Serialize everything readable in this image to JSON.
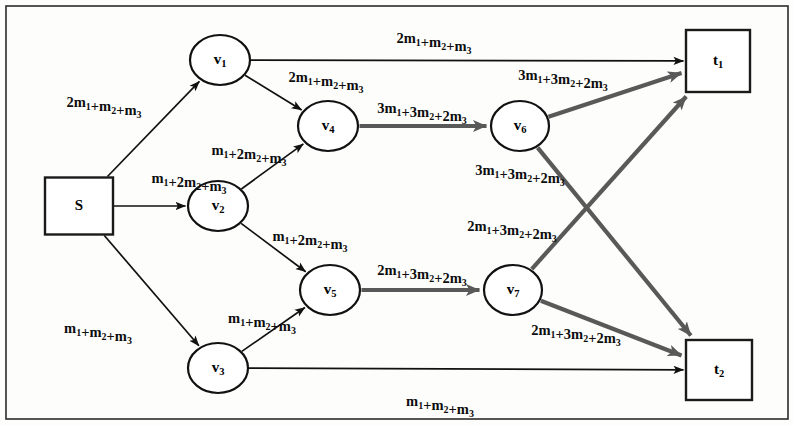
{
  "figure": {
    "kind": "network-flow-graph",
    "width": 794,
    "height": 425,
    "background_color": "#fdfdfb",
    "frame_color": "#2b2b2b",
    "thin_edge_color": "#111111",
    "thick_edge_color": "#595959"
  },
  "nodes": [
    {
      "id": "S",
      "label_main": "S",
      "label_sub": "",
      "shape": "square",
      "cx": 79,
      "cy": 206,
      "w": 68,
      "h": 57
    },
    {
      "id": "v1",
      "label_main": "v",
      "label_sub": "1",
      "shape": "circle",
      "cx": 220,
      "cy": 60,
      "rx": 30,
      "ry": 25
    },
    {
      "id": "v2",
      "label_main": "v",
      "label_sub": "2",
      "shape": "circle",
      "cx": 218,
      "cy": 206,
      "rx": 30,
      "ry": 25
    },
    {
      "id": "v3",
      "label_main": "v",
      "label_sub": "3",
      "shape": "circle",
      "cx": 218,
      "cy": 368,
      "rx": 30,
      "ry": 25
    },
    {
      "id": "v4",
      "label_main": "v",
      "label_sub": "4",
      "shape": "circle",
      "cx": 328,
      "cy": 126,
      "rx": 30,
      "ry": 25
    },
    {
      "id": "v5",
      "label_main": "v",
      "label_sub": "5",
      "shape": "circle",
      "cx": 330,
      "cy": 290,
      "rx": 30,
      "ry": 25
    },
    {
      "id": "v6",
      "label_main": "v",
      "label_sub": "6",
      "shape": "circle",
      "cx": 520,
      "cy": 126,
      "rx": 29,
      "ry": 25
    },
    {
      "id": "v7",
      "label_main": "v",
      "label_sub": "7",
      "shape": "circle",
      "cx": 513,
      "cy": 290,
      "rx": 29,
      "ry": 25
    },
    {
      "id": "t1",
      "label_main": "t",
      "label_sub": "1",
      "shape": "square",
      "cx": 718,
      "cy": 61,
      "w": 64,
      "h": 62
    },
    {
      "id": "t2",
      "label_main": "t",
      "label_sub": "2",
      "shape": "square",
      "cx": 719,
      "cy": 370,
      "w": 66,
      "h": 60
    }
  ],
  "edges": [
    {
      "id": "S-v1",
      "from": "S",
      "to": "v1",
      "style": "thin",
      "label": "2m_1+m_2+m_3",
      "label_x": 104,
      "label_y": 104
    },
    {
      "id": "S-v2",
      "from": "S",
      "to": "v2",
      "style": "thin",
      "label": "m_1+2m_2+m_3",
      "label_x": 189,
      "label_y": 180
    },
    {
      "id": "S-v3",
      "from": "S",
      "to": "v3",
      "style": "thin",
      "label": "m_1+m_2+m_3",
      "label_x": 98,
      "label_y": 330
    },
    {
      "id": "v1-v4",
      "from": "v1",
      "to": "v4",
      "style": "thin",
      "label": "2m_1+m_2+m_3",
      "label_x": 326,
      "label_y": 79
    },
    {
      "id": "v1-t1",
      "from": "v1",
      "to": "t1",
      "style": "thin",
      "label": "2m_1+m_2+m_3",
      "label_x": 434,
      "label_y": 40
    },
    {
      "id": "v2-v4",
      "from": "v2",
      "to": "v4",
      "style": "thin",
      "label": "m_1+2m_2+m_3",
      "label_x": 249,
      "label_y": 152
    },
    {
      "id": "v2-v5",
      "from": "v2",
      "to": "v5",
      "style": "thin",
      "label": "m_1+2m_2+m_3",
      "label_x": 310,
      "label_y": 238
    },
    {
      "id": "v3-v5",
      "from": "v3",
      "to": "v5",
      "style": "thin",
      "label": "m_1+m_2+m_3",
      "label_x": 262,
      "label_y": 320
    },
    {
      "id": "v3-t2",
      "from": "v3",
      "to": "t2",
      "style": "thin",
      "label": "m_1+m_2+m_3",
      "label_x": 440,
      "label_y": 403
    },
    {
      "id": "v4-v6",
      "from": "v4",
      "to": "v6",
      "style": "thick",
      "label": "3m_1+3m_2+2m_3",
      "label_x": 422,
      "label_y": 110
    },
    {
      "id": "v5-v7",
      "from": "v5",
      "to": "v7",
      "style": "thick",
      "label": "2m_1+3m_2+2m_3",
      "label_x": 422,
      "label_y": 272
    },
    {
      "id": "v6-t1",
      "from": "v6",
      "to": "t1",
      "style": "thick",
      "label": "3m_1+3m_2+2m_3",
      "label_x": 563,
      "label_y": 77
    },
    {
      "id": "v6-t2",
      "from": "v6",
      "to": "t2",
      "style": "thick",
      "label": "3m_1+3m_2+2m_3",
      "label_x": 520,
      "label_y": 172
    },
    {
      "id": "v7-t1",
      "from": "v7",
      "to": "t1",
      "style": "thick",
      "label": "2m_1+3m_2+2m_3",
      "label_x": 512,
      "label_y": 228
    },
    {
      "id": "v7-t2",
      "from": "v7",
      "to": "t2",
      "style": "thick",
      "label": "2m_1+3m_2+2m_3",
      "label_x": 576,
      "label_y": 332
    }
  ]
}
